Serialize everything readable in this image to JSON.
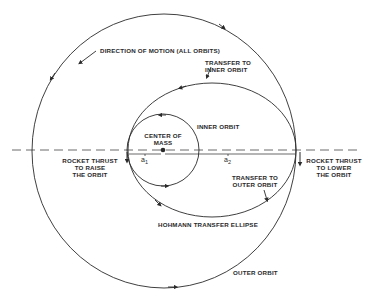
{
  "diagram": {
    "labels": {
      "direction": "DIRECTION OF MOTION (ALL ORBITS)",
      "transfer_inner_1": "TRANSFER TO",
      "transfer_inner_2": "INNER ORBIT",
      "center_1": "CENTER OF",
      "center_2": "MASS",
      "inner_orbit": "INNER ORBIT",
      "raise_1": "ROCKET THRUST",
      "raise_2": "TO RAISE",
      "raise_3": "THE ORBIT",
      "lower_1": "ROCKET THRUST",
      "lower_2": "TO LOWER",
      "lower_3": "THE ORBIT",
      "transfer_outer_1": "TRANSFER TO",
      "transfer_outer_2": "OUTER ORBIT",
      "hohmann": "HOHMANN TRANSFER ELLIPSE",
      "outer_orbit": "OUTER ORBIT",
      "a1": "a",
      "a1_sub": "1",
      "a2": "a",
      "a2_sub": "2"
    },
    "colors": {
      "line": "#2a2a2a",
      "dash": "#6a6a6a",
      "background": "#ffffff"
    },
    "geometry": {
      "center_of_mass": [
        163,
        150
      ],
      "inner_orbit_radius": 36,
      "outer_orbit_radius": 133,
      "transfer_ellipse": {
        "cx": 212,
        "cy": 150,
        "rx": 84,
        "ry": 67
      }
    }
  }
}
